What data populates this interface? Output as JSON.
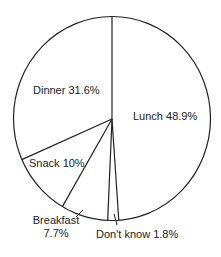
{
  "chart_data": {
    "type": "pie",
    "title": "",
    "start_angle_deg": 0,
    "direction": "clockwise",
    "slices": [
      {
        "label": "Lunch",
        "value": 48.9,
        "display": "Lunch 48.9%"
      },
      {
        "label": "Don't know",
        "value": 1.8,
        "display": "Don't know 1.8%"
      },
      {
        "label": "Breakfast",
        "value": 7.7,
        "display_line1": "Breakfast",
        "display_line2": "7.7%"
      },
      {
        "label": "Snack",
        "value": 10,
        "display": "Snack 10%"
      },
      {
        "label": "Dinner",
        "value": 31.6,
        "display": "Dinner 31.6%"
      }
    ],
    "categories": [
      "Lunch",
      "Don't know",
      "Breakfast",
      "Snack",
      "Dinner"
    ],
    "values": [
      48.9,
      1.8,
      7.7,
      10,
      31.6
    ],
    "unit": "%",
    "legend": "none (labels placed on/near slices)",
    "colors": {
      "stroke": "#222222",
      "fill": "#ffffff",
      "text": "#222222"
    }
  }
}
